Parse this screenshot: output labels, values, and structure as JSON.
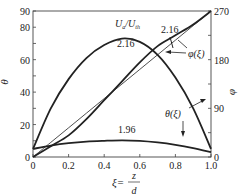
{
  "chart_data": {
    "type": "line",
    "title": "",
    "xlabel": "ξ = z/d",
    "ylabel_left": "θ",
    "ylabel_right": "φ",
    "xlim": [
      0,
      1.0
    ],
    "ylim_left": [
      0,
      90
    ],
    "ylim_right": [
      0,
      270
    ],
    "x_ticks": [
      "0",
      "0.2",
      "0.4",
      "0.6",
      "0.8",
      "1.0"
    ],
    "y_ticks_left": [
      "0",
      "20",
      "40",
      "60",
      "80",
      "90"
    ],
    "y_ticks_right": [
      "0",
      "90",
      "180",
      "270"
    ],
    "grid": false,
    "x": [
      0,
      0.1,
      0.2,
      0.3,
      0.4,
      0.5,
      0.6,
      0.7,
      0.8,
      0.9,
      1.0
    ],
    "series": [
      {
        "name": "θ(ξ), U_a/U_th = 2.16",
        "axis": "left",
        "values": [
          5,
          30,
          48,
          61,
          69,
          73,
          71,
          63,
          49,
          30,
          5
        ]
      },
      {
        "name": "θ(ξ), U_a/U_th = 1.96",
        "axis": "left",
        "values": [
          5,
          7,
          8.5,
          9.5,
          10,
          10.3,
          10,
          9,
          7.5,
          5.5,
          3
        ]
      },
      {
        "name": "φ(ξ), U_a/U_th = 2.16",
        "axis": "right",
        "values": [
          0,
          20,
          40,
          70,
          105,
          140,
          175,
          205,
          225,
          245,
          270
        ]
      },
      {
        "name": "φ(ξ), linear",
        "axis": "right",
        "values": [
          0,
          27,
          54,
          81,
          108,
          135,
          162,
          189,
          216,
          243,
          270
        ]
      }
    ],
    "annotations": [
      "U_a/U_th",
      "2.16",
      "2.16",
      "1.96",
      "φ(ξ)",
      "θ(ξ)"
    ]
  },
  "labels": {
    "ratio": "U",
    "ratio_sub_a": "a",
    "ratio_slash": "/U",
    "ratio_sub_th": "th",
    "val_216_theta": "2.16",
    "val_216_phi": "2.16",
    "val_196": "1.96",
    "phi_xi": "φ(ξ)",
    "theta_xi": "θ(ξ)",
    "theta_axis": "θ",
    "phi_axis": "φ",
    "xi_eq": "ξ=",
    "z": "z",
    "d": "d"
  }
}
